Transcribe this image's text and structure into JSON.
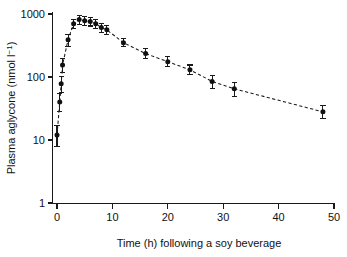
{
  "figure": {
    "background_color": "#ffffff",
    "ink_color": "#111111"
  },
  "chart_data": {
    "type": "line",
    "title": "",
    "subtitle": "",
    "xlabel": "Time (h) following a soy beverage",
    "ylabel": "Plasma aglycone (nmol l⁻¹)",
    "ylabel_parts": {
      "main": "Plasma aglycone (nmol l",
      "superscript": "−1",
      "tail": ")"
    },
    "yscale": "log",
    "xscale": "linear",
    "xlim": [
      0,
      50
    ],
    "ylim": [
      1,
      1000
    ],
    "grid": false,
    "legend": null,
    "legend_position": "none",
    "xticks": [
      0,
      10,
      20,
      30,
      40,
      50
    ],
    "xtick_labels": [
      "0",
      "10",
      "20",
      "30",
      "40",
      "50"
    ],
    "yticks": [
      1,
      10,
      100,
      1000
    ],
    "ytick_labels": [
      "1",
      "10",
      "100",
      "1000"
    ],
    "marker": "filled-circle",
    "linestyle": "dashed",
    "error_bars": "vertical",
    "x": [
      0,
      0.5,
      0.75,
      1,
      2,
      3,
      4,
      5,
      6,
      7,
      8,
      9,
      12,
      16,
      20,
      24,
      28,
      32,
      48
    ],
    "y": [
      12,
      40,
      78,
      155,
      390,
      700,
      820,
      780,
      760,
      700,
      610,
      560,
      350,
      235,
      175,
      130,
      85,
      65,
      28
    ],
    "yerr_low": [
      4,
      12,
      22,
      38,
      80,
      120,
      130,
      120,
      115,
      110,
      95,
      85,
      50,
      40,
      30,
      22,
      20,
      16,
      6
    ],
    "yerr_high": [
      5,
      14,
      25,
      42,
      90,
      130,
      140,
      130,
      125,
      120,
      105,
      95,
      55,
      45,
      33,
      25,
      22,
      18,
      7
    ],
    "series": [
      {
        "name": "Plasma aglycone",
        "values": [
          12,
          40,
          78,
          155,
          390,
          700,
          820,
          780,
          760,
          700,
          610,
          560,
          350,
          235,
          175,
          130,
          85,
          65,
          28
        ]
      }
    ]
  }
}
